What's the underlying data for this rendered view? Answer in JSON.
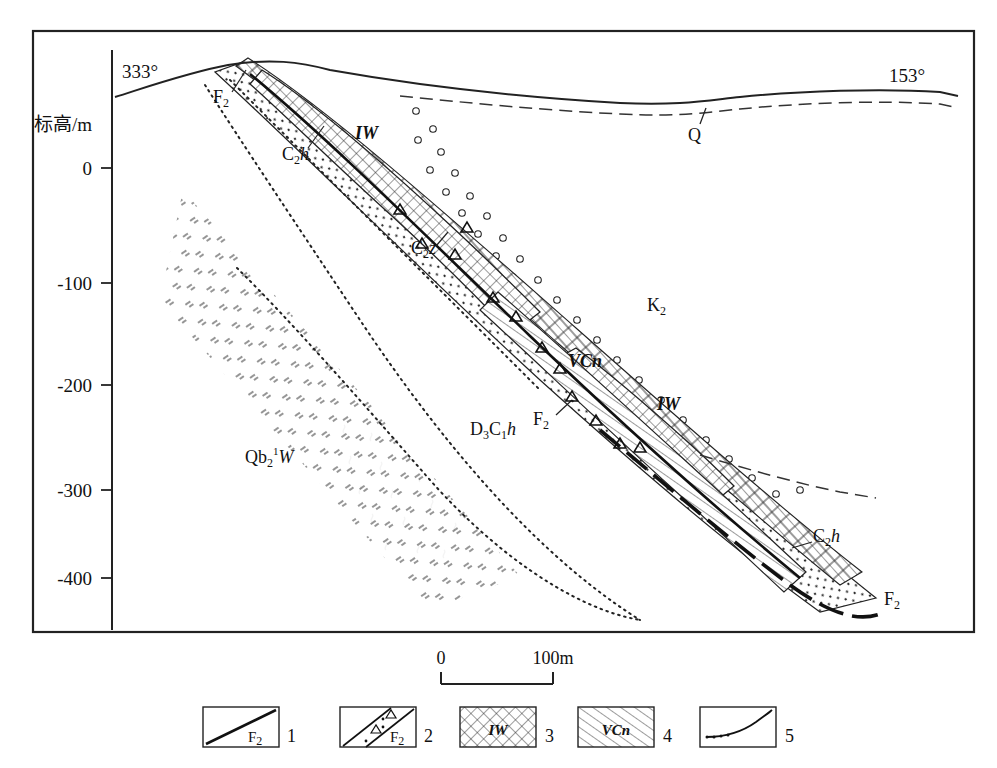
{
  "figure": {
    "type": "geological-cross-section",
    "axis": {
      "title": "标高/m",
      "ticks": [
        "0",
        "-100",
        "-200",
        "-300",
        "-400"
      ],
      "tick_values": [
        0,
        -100,
        -200,
        -300,
        -400
      ]
    },
    "bearings": {
      "left": "333°",
      "right": "153°"
    },
    "scale_bar": {
      "start": "0",
      "end": "100m"
    },
    "unit_labels": [
      {
        "id": "f2-top",
        "text": "F",
        "sub": "2",
        "sup": "",
        "x": 221,
        "y": 99,
        "italic": false
      },
      {
        "id": "c2h-upper",
        "text": "C",
        "sub": "2",
        "sup": "",
        "x": 288,
        "y": 158,
        "italic": false,
        "tail": "h"
      },
      {
        "id": "iw-upper",
        "text": "IW",
        "sub": "",
        "sup": "",
        "x": 360,
        "y": 134,
        "italic": true
      },
      {
        "id": "q-surface",
        "text": "Q",
        "sub": "",
        "sup": "",
        "x": 694,
        "y": 136,
        "italic": false
      },
      {
        "id": "c2z",
        "text": "C",
        "sub": "2",
        "sup": "",
        "x": 418,
        "y": 250,
        "italic": false,
        "tail": "z"
      },
      {
        "id": "k2",
        "text": "K",
        "sub": "2",
        "sup": "",
        "x": 654,
        "y": 305,
        "italic": false
      },
      {
        "id": "vcn-mid",
        "text": "VCn",
        "sub": "",
        "sup": "",
        "x": 577,
        "y": 362,
        "italic": true
      },
      {
        "id": "iw-lower",
        "text": "IW",
        "sub": "",
        "sup": "",
        "x": 665,
        "y": 405,
        "italic": true
      },
      {
        "id": "f2-mid",
        "text": "F",
        "sub": "2",
        "sup": "",
        "x": 540,
        "y": 421,
        "italic": false
      },
      {
        "id": "d3c1h",
        "text": "D",
        "sub": "3",
        "sup": "",
        "x": 478,
        "y": 430,
        "italic": false,
        "tail": "C₁h"
      },
      {
        "id": "qb2w",
        "text": "Qb",
        "sub": "2",
        "sup": "1",
        "x": 253,
        "y": 458,
        "italic": false,
        "tail": "W"
      },
      {
        "id": "c2h-lower",
        "text": "C",
        "sub": "2",
        "sup": "",
        "x": 820,
        "y": 537,
        "italic": false,
        "tail": "h"
      },
      {
        "id": "f2-bottom",
        "text": "F",
        "sub": "2",
        "sup": "",
        "x": 890,
        "y": 600,
        "italic": false
      }
    ],
    "legend": [
      {
        "num": "1",
        "label": "F",
        "sub": "2",
        "pattern": "fault-line"
      },
      {
        "num": "2",
        "label": "F",
        "sub": "2",
        "pattern": "fault-breccia-zone"
      },
      {
        "num": "3",
        "label": "IW",
        "sub": "",
        "pattern": "cross-hatch"
      },
      {
        "num": "4",
        "label": "VCn",
        "sub": "",
        "pattern": "diagonal-hatch"
      },
      {
        "num": "5",
        "label": "",
        "sub": "",
        "pattern": "dotted-curve-boundary"
      }
    ]
  }
}
